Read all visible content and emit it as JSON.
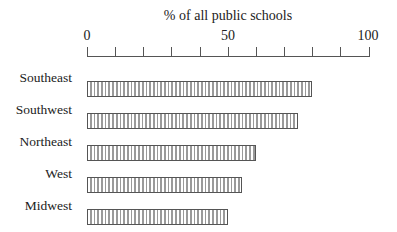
{
  "chart_data": {
    "type": "bar",
    "orientation": "horizontal",
    "title": "% of all public schools",
    "xlabel": "% of all public schools",
    "ylabel": "",
    "xlim": [
      0,
      100
    ],
    "x_ticks": [
      0,
      10,
      20,
      30,
      40,
      50,
      60,
      70,
      80,
      90,
      100
    ],
    "x_tick_labels": [
      "0",
      "50",
      "100"
    ],
    "categories": [
      "Southeast",
      "Southwest",
      "Northeast",
      "West",
      "Midwest"
    ],
    "values": [
      80,
      75,
      60,
      55,
      50
    ],
    "grid": false,
    "legend": null,
    "bar_fill": "vertical hatch pattern",
    "bar_color": "#9a9a9a",
    "bar_border_color": "#555555"
  },
  "labels": {
    "title": "% of all public schools",
    "tick_0": "0",
    "tick_50": "50",
    "tick_100": "100"
  }
}
